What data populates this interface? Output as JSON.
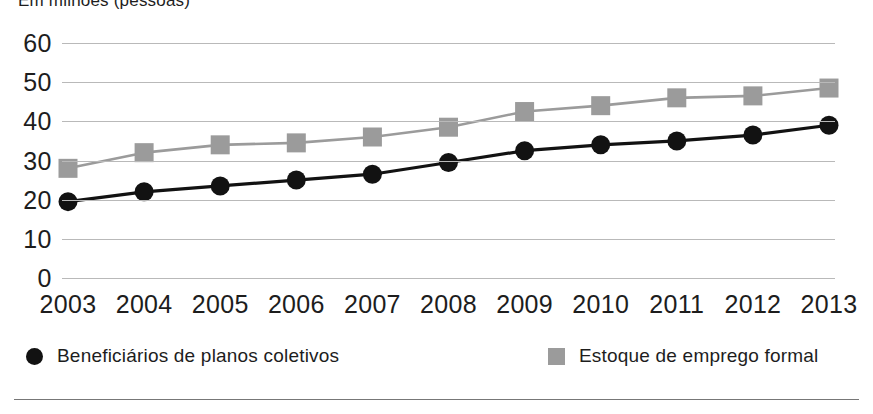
{
  "title": "Em milhões (pessoas)",
  "legend": [
    {
      "label": "Beneficiários de planos coletivos",
      "marker": "circle",
      "color": "#121212"
    },
    {
      "label": "Estoque de emprego formal",
      "marker": "square",
      "color": "#9b9b9b"
    }
  ],
  "chart_data": {
    "type": "line",
    "title": "Em milhões (pessoas)",
    "xlabel": "",
    "ylabel": "",
    "ylim": [
      0,
      60
    ],
    "yticks": [
      0,
      10,
      20,
      30,
      40,
      50,
      60
    ],
    "grid": true,
    "legend_position": "bottom",
    "categories": [
      "2003",
      "2004",
      "2005",
      "2006",
      "2007",
      "2008",
      "2009",
      "2010",
      "2011",
      "2012",
      "2013"
    ],
    "series": [
      {
        "name": "Beneficiários de planos coletivos",
        "color": "#121212",
        "marker": "circle",
        "values": [
          19.5,
          22,
          23.5,
          25,
          26.5,
          29.5,
          32.5,
          34,
          35,
          36.5,
          39
        ]
      },
      {
        "name": "Estoque de emprego formal",
        "color": "#9b9b9b",
        "marker": "square",
        "values": [
          28,
          32,
          34,
          34.5,
          36,
          38.5,
          42.5,
          44,
          46,
          46.5,
          48.5
        ]
      }
    ]
  }
}
